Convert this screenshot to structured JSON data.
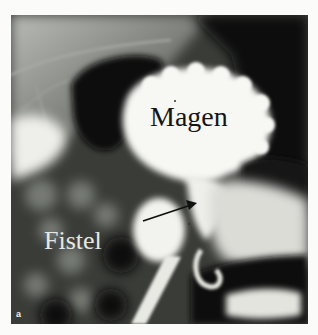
{
  "figure": {
    "panel_letter": "a",
    "labels": {
      "stomach": "Magen",
      "fistula": "Fistel"
    },
    "arrow": {
      "from": [
        143,
        221
      ],
      "to": [
        196,
        203
      ],
      "color": "#111111"
    },
    "colors": {
      "page_background": "#fbfbf9",
      "contrast_white": "#f5f5f2",
      "dark_tissue": "#0c0d0c",
      "mid_gray": "#6f726c"
    }
  }
}
